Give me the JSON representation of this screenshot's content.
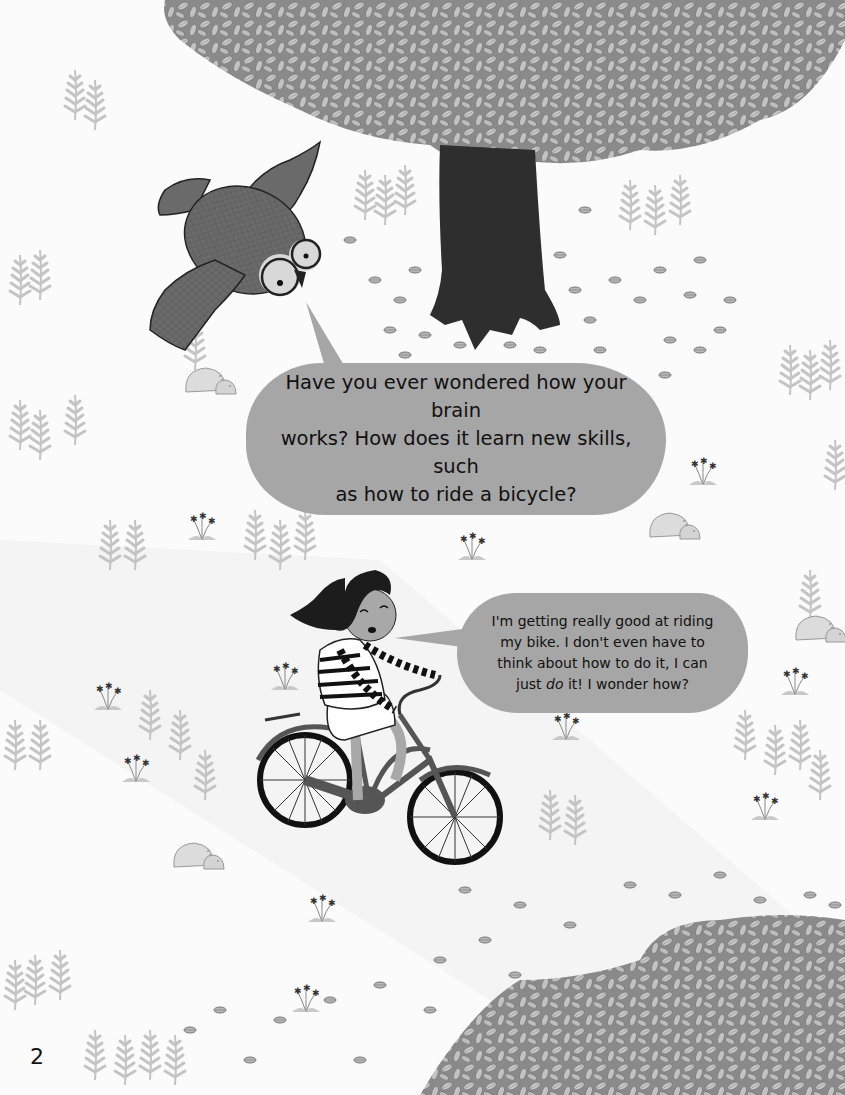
{
  "page": {
    "number": "2",
    "background": "#fbfbfb"
  },
  "owl_bubble": {
    "text_line1": "Have you ever wondered how your brain",
    "text_line2": "works? How does it learn new skills, such",
    "text_line3": "as how to ride a bicycle?",
    "color": "#a6a6a6"
  },
  "girl_bubble": {
    "text_line1": "I'm getting really good at riding",
    "text_line2": "my bike. I don't even have to",
    "text_line3": "think about how to do it, I can",
    "text_line4_pre": "just ",
    "text_line4_em": "do",
    "text_line4_post": " it! I wonder how?",
    "color": "#a6a6a6"
  },
  "illustration": {
    "characters": [
      "owl-with-glasses",
      "girl-on-bicycle"
    ],
    "elements": [
      "tree",
      "leaf-pile",
      "scattered-leaves",
      "ferns",
      "rocks",
      "flowers",
      "path"
    ],
    "colors": {
      "canopy": "#8a8a8a",
      "leaf_light": "#c8c8c8",
      "trunk": "#2e2e2e",
      "owl_body": "#6a6a6a",
      "fern": "#c4c4c4",
      "rock": "#dcdcdc",
      "path": "#f1f1f1"
    }
  }
}
